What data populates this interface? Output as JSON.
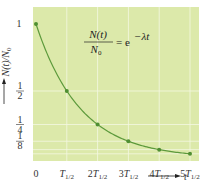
{
  "chart_data": {
    "type": "line",
    "title": "",
    "equation": {
      "numerator": "N(t)",
      "denominator": "N",
      "denominator_sub": "0",
      "rhs": "= e",
      "exponent": "−λt"
    },
    "xlabel": "t",
    "ylabel": "N(t)/N0",
    "ylabel_display": "N(t)/N",
    "ylabel_sub": "0",
    "x_ticks": [
      {
        "label": "0",
        "pre": "0",
        "sub": ""
      },
      {
        "label": "T1/2",
        "pre": "T",
        "sub": "1/2"
      },
      {
        "label": "2T1/2",
        "pre": "2T",
        "sub": "1/2"
      },
      {
        "label": "3T1/2",
        "pre": "3T",
        "sub": "1/2"
      },
      {
        "label": "4T1/2",
        "pre": "4T",
        "sub": "1/2"
      },
      {
        "label": "5T1/2",
        "pre": "5T",
        "sub": "1/2"
      }
    ],
    "y_ticks": [
      {
        "label": "1",
        "value": 1
      },
      {
        "label": "1/2",
        "num": "1",
        "den": "2",
        "value": 0.5
      },
      {
        "label": "1/4",
        "num": "1",
        "den": "4",
        "value": 0.25
      },
      {
        "label": "1/8",
        "num": "1",
        "den": "8",
        "value": 0.125
      }
    ],
    "x": [
      0,
      1,
      2,
      3,
      4,
      5
    ],
    "series": [
      {
        "name": "N(t)/N0",
        "values": [
          1,
          0.5,
          0.25,
          0.125,
          0.0625,
          0.03125
        ]
      }
    ],
    "xlim": [
      0,
      5
    ],
    "ylim": [
      0,
      1
    ],
    "grid": true,
    "legend": "none",
    "colors": {
      "plot_bg": "#dce9aa",
      "curve": "#5d9a3c",
      "marker": "#4f8f32",
      "grid": "#f4f8e2"
    }
  }
}
